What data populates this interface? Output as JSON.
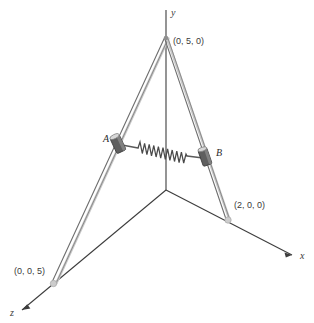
{
  "figure": {
    "background_color": "#ffffff",
    "axes": [
      {
        "id": "y",
        "label": "y",
        "label_x": 171,
        "label_y": 16
      },
      {
        "id": "x",
        "label": "x",
        "label_x": 300,
        "label_y": 259
      },
      {
        "id": "z",
        "label": "z",
        "label_x": 10,
        "label_y": 316
      }
    ],
    "points": [
      {
        "id": "apex",
        "label": "(0, 5, 0)",
        "label_x": 173,
        "label_y": 44,
        "px": 166,
        "py": 38
      },
      {
        "id": "x-strut-base",
        "label": "(2, 0, 0)",
        "label_x": 234,
        "label_y": 208,
        "px": 228,
        "py": 220
      },
      {
        "id": "z-strut-base",
        "label": "(0, 0, 5)",
        "label_x": 14,
        "label_y": 274,
        "px": 53,
        "py": 283
      }
    ],
    "collars": [
      {
        "id": "A",
        "label": "A",
        "label_x": 103,
        "label_y": 142,
        "px": 118,
        "py": 144
      },
      {
        "id": "B",
        "label": "B",
        "label_x": 216,
        "label_y": 156,
        "px": 205,
        "py": 157
      }
    ],
    "spring": {
      "name": "spring",
      "start_x": 137,
      "start_y": 147,
      "end_x": 188,
      "end_y": 157,
      "coils": 12
    },
    "origin": {
      "px": 166,
      "py": 190
    },
    "colors": {
      "axis_line": "#3d3d3d",
      "strut_dark": "#6e6e6e",
      "strut_light": "#c9c9c9",
      "collar_fill": "#5f5f5f",
      "collar_stroke": "#3a3a3a",
      "spring_stroke": "#4a4a4a",
      "text": "#3a3a3a"
    }
  }
}
